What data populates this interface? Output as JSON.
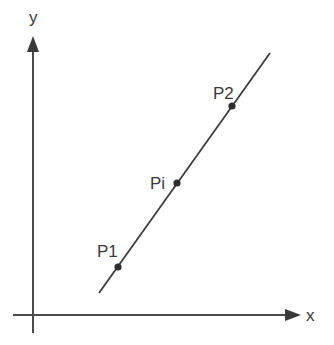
{
  "diagram": {
    "type": "coordinate-line-diagram",
    "colors": {
      "axis": "#4a4a4a",
      "line": "#3d3d3d",
      "point": "#2e2e2e",
      "text": "#3a3a3a",
      "background": "#ffffff"
    },
    "axes": {
      "x": {
        "label": "x"
      },
      "y": {
        "label": "y"
      }
    },
    "line": {
      "start_px": [
        99,
        293
      ],
      "end_px": [
        270,
        53
      ]
    },
    "points": [
      {
        "id": "p1",
        "label": "P1",
        "px": [
          118,
          267
        ]
      },
      {
        "id": "pi",
        "label": "Pi",
        "px": [
          177,
          183
        ]
      },
      {
        "id": "p2",
        "label": "P2",
        "px": [
          232,
          106
        ]
      }
    ]
  }
}
